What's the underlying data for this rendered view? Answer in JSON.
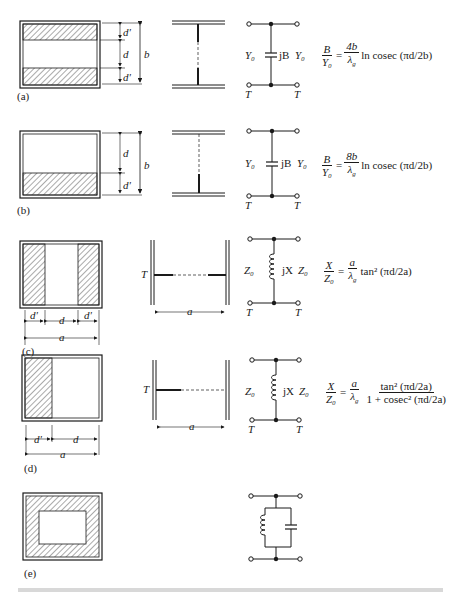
{
  "figure": {
    "panels": [
      {
        "id": "a",
        "label": "(a)",
        "cross_section": {
          "dims": [
            "d'",
            "d",
            "d'",
            "b"
          ]
        },
        "circuit": {
          "left": "Y₀",
          "element": "jB",
          "right": "Y₀",
          "terminals": [
            "T",
            "T"
          ]
        },
        "equation": {
          "lhs_num": "B",
          "lhs_den": "Y₀",
          "eq": "=",
          "rhs_num": "4b",
          "rhs_den": "λ",
          "rhs_den_sub": "g",
          "tail": "ln cosec (πd/2b)"
        }
      },
      {
        "id": "b",
        "label": "(b)",
        "cross_section": {
          "dims": [
            "d",
            "d'",
            "b"
          ]
        },
        "circuit": {
          "left": "Y₀",
          "element": "jB",
          "right": "Y₀",
          "terminals": [
            "T",
            "T"
          ]
        },
        "equation": {
          "lhs_num": "B",
          "lhs_den": "Y₀",
          "eq": "=",
          "rhs_num": "8b",
          "rhs_den": "λ",
          "rhs_den_sub": "g",
          "tail": "ln cosec (πd/2b)"
        }
      },
      {
        "id": "c",
        "label": "(c)",
        "cross_section": {
          "dims": [
            "d'",
            "d",
            "d'",
            "a"
          ]
        },
        "side_view": {
          "terminal": "T",
          "width": "a"
        },
        "circuit": {
          "left": "Z₀",
          "element": "jX",
          "right": "Z₀",
          "terminals": [
            "T",
            "T"
          ]
        },
        "equation": {
          "lhs_num": "X",
          "lhs_den": "Z₀",
          "eq": "=",
          "rhs_num": "a",
          "rhs_den": "λ",
          "rhs_den_sub": "g",
          "tail": "tan² (πd/2a)"
        }
      },
      {
        "id": "d",
        "label": "(d)",
        "cross_section": {
          "dims": [
            "d'",
            "d",
            "a"
          ]
        },
        "side_view": {
          "terminal": "T",
          "width": "a"
        },
        "circuit": {
          "left": "Z₀",
          "element": "jX",
          "right": "Z₀",
          "terminals": [
            "T",
            "T"
          ]
        },
        "equation": {
          "lhs_num": "X",
          "lhs_den": "Z₀",
          "eq": "=",
          "rhs_num": "a",
          "rhs_den": "λ",
          "rhs_den_sub": "g",
          "frac2_num": "tan² (πd/2a)",
          "frac2_den": "1 + cosec² (πd/2a)"
        }
      },
      {
        "id": "e",
        "label": "(e)",
        "circuit": {
          "type": "parallel LC resonant"
        }
      }
    ]
  }
}
